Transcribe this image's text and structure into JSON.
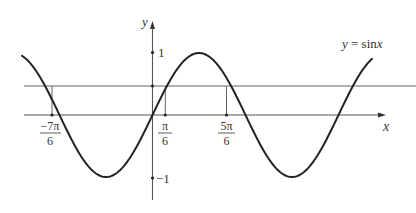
{
  "figure": {
    "curve_label": {
      "prefix": "y",
      "equals": " = sin",
      "var": "x"
    },
    "axes": {
      "x_label": "x",
      "y_label": "y",
      "y_ticks": [
        {
          "value": 1,
          "label": "1"
        },
        {
          "value": -1,
          "label": "−1"
        }
      ],
      "x_ticks": [
        {
          "id": "neg7pi6",
          "num": "−7π",
          "den": "6"
        },
        {
          "id": "pi6",
          "num": "π",
          "den": "6"
        },
        {
          "id": "fivepi6",
          "num": "5π",
          "den": "6"
        }
      ]
    },
    "colors": {
      "curve": "#222222",
      "axis": "#555555",
      "guide": "#666666"
    }
  },
  "chart_data": {
    "type": "line",
    "title": "",
    "xlabel": "x",
    "ylabel": "y",
    "series": [
      {
        "name": "y = sin x",
        "function": "sin(x)",
        "x_range": [
          "-1.4π",
          "2.35π"
        ]
      },
      {
        "name": "horizontal line",
        "function": "y = 1/2",
        "x_range": [
          "-1.4π",
          "2.5π"
        ]
      }
    ],
    "x_tick_labels": [
      "−7π/6",
      "π/6",
      "5π/6"
    ],
    "y_tick_labels": [
      "1",
      "−1"
    ],
    "marked_intersections": [
      {
        "x": "−7π/6",
        "y": 0.5
      },
      {
        "x": "π/6",
        "y": 0.5
      },
      {
        "x": "5π/6",
        "y": 0.5
      }
    ],
    "ylim": [
      -1.2,
      1.3
    ],
    "grid": false,
    "legend": "inline label near right end of curve"
  }
}
